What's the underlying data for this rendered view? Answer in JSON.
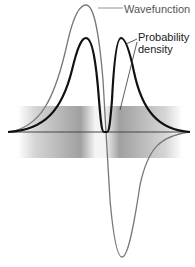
{
  "labels": {
    "wavefunction": "Wavefunction",
    "probability_density_line1": "Probability",
    "probability_density_line2": "density"
  },
  "colors": {
    "wavefunction": "#777777",
    "density": "#111111",
    "band": "#9a9a9a"
  }
}
